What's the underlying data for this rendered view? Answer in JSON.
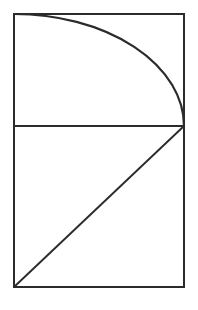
{
  "figure": {
    "background_color": "#ffffff",
    "stroke_color": "#2b2b2b",
    "canvas": {
      "width": 198,
      "height": 310
    },
    "outer_rectangle": {
      "name": "outer-rectangle",
      "x": 14,
      "y": 14,
      "width": 170,
      "height": 273,
      "left": 14,
      "top": 14,
      "right": 184,
      "bottom": 287,
      "stroke_width": 2
    },
    "divider_line": {
      "name": "horizontal-divider",
      "x1": 14,
      "y1": 126,
      "x2": 184,
      "y2": 126,
      "stroke_width": 2.1
    },
    "upper_panel": {
      "name": "upper-panel",
      "x": 14,
      "y": 14,
      "width": 170,
      "height": 112
    },
    "lower_panel": {
      "name": "lower-panel",
      "x": 14,
      "y": 126,
      "width": 170,
      "height": 161
    },
    "arc": {
      "name": "quarter-ellipse-arc",
      "center_x": 14,
      "center_y": 126,
      "radius_x": 170,
      "radius_y": 112,
      "start_x": 14,
      "start_y": 14,
      "end_x": 184,
      "end_y": 126,
      "sweep": "clockwise",
      "stroke_width": 2.2,
      "path": "M 14 14 A 170 112 0 0 1 184 126"
    },
    "diagonal": {
      "name": "diagonal-line",
      "x1": 14,
      "y1": 287,
      "x2": 184,
      "y2": 126,
      "stroke_width": 1.9
    },
    "vertices": {
      "top_left": "14,14",
      "top_right": "184,14",
      "bottom_left": "14,287",
      "bottom_right": "184,287",
      "mid_left": "14,126",
      "mid_right": "184,126"
    }
  }
}
